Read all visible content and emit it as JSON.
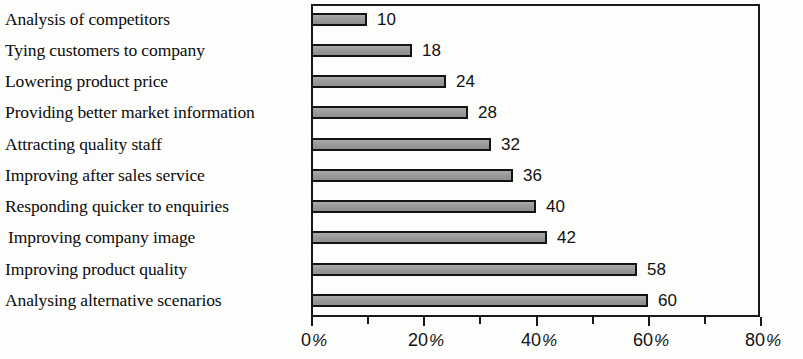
{
  "chart_data": {
    "type": "bar",
    "orientation": "horizontal",
    "title": "",
    "xlabel": "",
    "ylabel": "",
    "xlim": [
      0,
      80
    ],
    "grid": false,
    "legend": false,
    "categories": [
      "Analysis of competitors",
      "Tying customers to company",
      "Lowering product price",
      "Providing better market information",
      "Attracting quality staff",
      "Improving after sales service",
      "Responding quicker to enquiries",
      "Improving company image",
      "Improving product quality",
      "Analysing alternative scenarios"
    ],
    "values": [
      10,
      18,
      24,
      28,
      32,
      36,
      40,
      42,
      58,
      60
    ],
    "value_labels": [
      "10",
      "18",
      "24",
      "28",
      "32",
      "36",
      "40",
      "42",
      "58",
      "60"
    ],
    "xticks": [
      0,
      20,
      40,
      60,
      80
    ],
    "xtick_labels": [
      "0 %",
      "20 %",
      "40 %",
      "60 %",
      "80 %"
    ],
    "xtick_numbers": [
      "0",
      "20",
      "40",
      "60",
      "80"
    ],
    "xtick_suffix": "%",
    "minor_xticks": [
      10,
      30,
      50,
      70
    ],
    "bar_fill_color": "#9d9d9d",
    "bar_border_color": "#141414",
    "axis_color": "#1a1a1a",
    "background_color": "#fdfdfb"
  }
}
